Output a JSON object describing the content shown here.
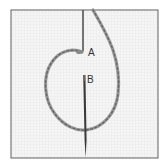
{
  "diagram": {
    "labels": [
      {
        "id": "A",
        "text": "A"
      },
      {
        "id": "B",
        "text": "B"
      }
    ],
    "colors": {
      "background": "#ffffff",
      "fabric": "#f4f4f4",
      "frame": "#7a7a7a",
      "thread": "#8c8c8c",
      "needle": "#3a3a3a"
    }
  }
}
